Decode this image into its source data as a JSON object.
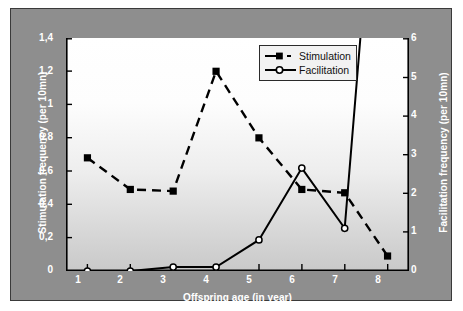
{
  "chart_data": {
    "type": "line",
    "title": "",
    "xlabel": "Offspring age (in year)",
    "ylabel": "Stimulation frequency (per 10mn)",
    "y2label": "Facilitation frequency (per 10mn)",
    "categories": [
      "1",
      "2",
      "3",
      "4",
      "5",
      "6",
      "7",
      "8"
    ],
    "x": [
      1,
      2,
      3,
      4,
      5,
      6,
      7,
      8
    ],
    "xlim": [
      0.5,
      8.5
    ],
    "ylim": [
      0,
      1.4
    ],
    "y2lim": [
      0,
      6
    ],
    "grid": false,
    "legend_position": "top-right",
    "xticks": [
      "1",
      "2",
      "3",
      "4",
      "5",
      "6",
      "7",
      "8"
    ],
    "yticks": [
      "0",
      "0,2",
      "0,4",
      "0,6",
      "0,8",
      "1",
      "1,2",
      "1,4"
    ],
    "ytick_values": [
      0,
      0.2,
      0.4,
      0.6,
      0.8,
      1.0,
      1.2,
      1.4
    ],
    "y2ticks": [
      "0",
      "1",
      "2",
      "3",
      "4",
      "5",
      "6"
    ],
    "y2tick_values": [
      0,
      1,
      2,
      3,
      4,
      5,
      6
    ],
    "series": [
      {
        "name": "Stimulation",
        "axis": "left",
        "line_style": "dashed",
        "marker": "filled-square",
        "color": "#000000",
        "values": [
          0.68,
          0.49,
          0.48,
          1.2,
          0.8,
          0.49,
          0.47,
          0.09
        ]
      },
      {
        "name": "Facilitation",
        "axis": "right",
        "line_style": "solid",
        "marker": "open-circle",
        "color": "#000000",
        "values": [
          0.0,
          0.0,
          0.1,
          0.1,
          0.8,
          2.65,
          1.1,
          14.5
        ],
        "note": "value at age 8 runs off the top of the plot (clipped above 6)"
      }
    ]
  },
  "axes": {
    "left": {
      "title": "Stimulation frequency (per 10mn)",
      "ticks": [
        "1,4",
        "1,2",
        "1",
        "0,8",
        "0,6",
        "0,4",
        "0,2",
        "0"
      ]
    },
    "right": {
      "title": "Facilitation frequency (per 10mn)",
      "ticks": [
        "6",
        "5",
        "4",
        "3",
        "2",
        "1",
        "0"
      ]
    },
    "bottom": {
      "title": "Offspring age (in year)",
      "ticks": [
        "1",
        "2",
        "3",
        "4",
        "5",
        "6",
        "7",
        "8"
      ]
    }
  },
  "legend": {
    "items": [
      {
        "label": "Stimulation",
        "marker": "filled-square-marker",
        "style": "dashed"
      },
      {
        "label": "Facilitation",
        "marker": "open-circle-marker",
        "style": "solid"
      }
    ]
  },
  "colors": {
    "plate_background": "#8e8e8e",
    "plot_background": "#ffffff",
    "series_line": "#000000",
    "tick_text": "#ffffff",
    "legend_background": "#f2f2f2"
  }
}
